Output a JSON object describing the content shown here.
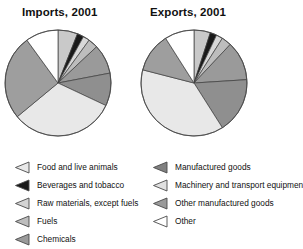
{
  "charts": {
    "imports": {
      "title": "Imports, 2001"
    },
    "exports": {
      "title": "Exports, 2001"
    }
  },
  "legend": {
    "left_column": [
      {
        "label": "Food and live animals",
        "swatch": "triangle-swatch-icon",
        "color": "#e8e8e8"
      },
      {
        "label": "Beverages and tobacco",
        "swatch": "triangle-swatch-icon",
        "color": "#1a1a1a"
      },
      {
        "label": "Raw materials, except fuels",
        "swatch": "triangle-swatch-icon",
        "color": "#d4d4d4"
      },
      {
        "label": "Fuels",
        "swatch": "triangle-swatch-icon",
        "color": "#bdbdbd"
      },
      {
        "label": "Chemicals",
        "swatch": "triangle-swatch-icon",
        "color": "#9a9a9a"
      }
    ],
    "right_column": [
      {
        "label": "Manufactured goods",
        "swatch": "triangle-swatch-icon",
        "color": "#808080"
      },
      {
        "label": "Machinery and transport equipment",
        "swatch": "triangle-swatch-icon",
        "color": "#e0e0e0"
      },
      {
        "label": "Other manufactured goods",
        "swatch": "triangle-swatch-icon",
        "color": "#9a9a9a"
      },
      {
        "label": "Other",
        "swatch": "triangle-swatch-icon",
        "color": "#ffffff"
      }
    ]
  },
  "chart_data": [
    {
      "type": "pie",
      "title": "Imports, 2001",
      "id": "imports",
      "start_angle_deg": -90,
      "direction": "clockwise",
      "categories": [
        "Food and live animals",
        "Beverages and tobacco",
        "Raw materials, except fuels",
        "Fuels",
        "Chemicals",
        "Manufactured goods",
        "Machinery and transport equipment",
        "Other manufactured goods",
        "Other"
      ],
      "values": [
        6,
        2,
        2,
        3,
        9,
        10,
        32,
        26,
        10
      ],
      "colors": [
        "#c9c9c9",
        "#1a1a1a",
        "#d8d8d8",
        "#bdbdbd",
        "#9a9a9a",
        "#8f8f8f",
        "#e8e8e8",
        "#9e9e9e",
        "#ffffff"
      ],
      "unit": "percent"
    },
    {
      "type": "pie",
      "title": "Exports, 2001",
      "id": "exports",
      "start_angle_deg": -90,
      "direction": "clockwise",
      "categories": [
        "Food and live animals",
        "Beverages and tobacco",
        "Raw materials, except fuels",
        "Fuels",
        "Chemicals",
        "Manufactured goods",
        "Machinery and transport equipment",
        "Other manufactured goods",
        "Other"
      ],
      "values": [
        5,
        2,
        2,
        3,
        12,
        17,
        38,
        12,
        9
      ],
      "colors": [
        "#c9c9c9",
        "#1a1a1a",
        "#d8d8d8",
        "#bdbdbd",
        "#9a9a9a",
        "#8f8f8f",
        "#e8e8e8",
        "#9e9e9e",
        "#ffffff"
      ],
      "unit": "percent"
    }
  ]
}
